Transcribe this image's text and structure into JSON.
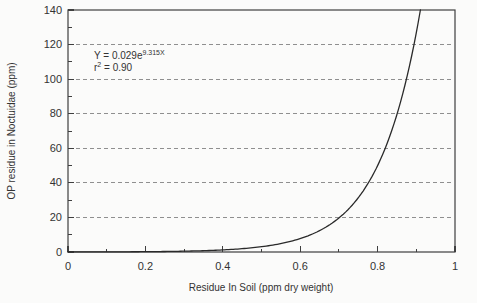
{
  "figure": {
    "background_color": "#fbfbfa",
    "frame_color": "#3f3f3f",
    "curve_color": "#2a2a2a",
    "grid_color": "#8f8f8f",
    "text_color": "#333333"
  },
  "chart_data": {
    "type": "line",
    "title": "",
    "xlabel": "Residue In Soil (ppm dry weight)",
    "ylabel": "OP residue in Noctuidae (ppm)",
    "xlim": [
      0,
      1
    ],
    "ylim": [
      0,
      140
    ],
    "x_major_ticks": [
      0,
      0.2,
      0.4,
      0.6,
      0.8,
      1
    ],
    "x_tick_labels": [
      "0",
      "0.2",
      "0.4",
      "0.6",
      "0.8",
      "1"
    ],
    "x_minor_ticks": [
      0.1,
      0.3,
      0.5,
      0.7,
      0.9
    ],
    "y_major_ticks": [
      0,
      20,
      40,
      60,
      80,
      100,
      120,
      140
    ],
    "y_tick_labels": [
      "0",
      "20",
      "40",
      "60",
      "80",
      "100",
      "120",
      "140"
    ],
    "y_minor_ticks": [
      10,
      30,
      50,
      70,
      90,
      110,
      130
    ],
    "grid": {
      "horizontal_values": [
        20,
        40,
        60,
        80,
        100,
        120
      ],
      "style": "dashed",
      "on": true
    },
    "legend": {
      "visible": false
    },
    "series": [
      {
        "name": "exponential-fit-curve",
        "model": "Y = a * exp(b * X)",
        "a": 0.029,
        "b": 9.315,
        "x_start": 0,
        "x_end_at_ymax": 0.911,
        "sample_points": [
          {
            "x": 0.0,
            "y": 0.029
          },
          {
            "x": 0.1,
            "y": 0.074
          },
          {
            "x": 0.2,
            "y": 0.187
          },
          {
            "x": 0.3,
            "y": 0.474
          },
          {
            "x": 0.4,
            "y": 1.2
          },
          {
            "x": 0.5,
            "y": 3.05
          },
          {
            "x": 0.6,
            "y": 7.74
          },
          {
            "x": 0.7,
            "y": 19.6
          },
          {
            "x": 0.8,
            "y": 49.8
          },
          {
            "x": 0.9,
            "y": 126.4
          }
        ]
      }
    ],
    "annotation": {
      "equation_base": "Y = 0.029e",
      "equation_exponent": "9.315X",
      "r_squared_base": "r",
      "r_squared_sup": "2",
      "r_squared_rest": " = 0.90"
    }
  }
}
